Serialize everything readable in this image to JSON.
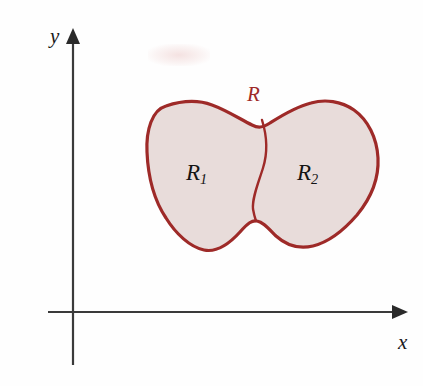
{
  "figure": {
    "type": "math-region-diagram",
    "background_color": "#fefefe"
  },
  "axes": {
    "x_label": "x",
    "y_label": "y",
    "axis_color": "#3a3a3a",
    "origin": {
      "x": 73,
      "y": 312
    },
    "x_axis": {
      "start_x": 48,
      "end_x": 400,
      "y": 312,
      "arrow": "right"
    },
    "y_axis": {
      "x": 73,
      "start_y": 365,
      "end_y": 30,
      "arrow": "up"
    }
  },
  "region": {
    "outline_color": "#9e2a28",
    "fill_color": "#e8dcda",
    "divider_color": "#9e2a28",
    "boundary_label": "R",
    "subregions": [
      {
        "id": "R1",
        "label": "R",
        "subscript": "1"
      },
      {
        "id": "R2",
        "label": "R",
        "subscript": "2"
      }
    ]
  },
  "artifacts": {
    "smudge": "faint-pink-scan-smudge"
  }
}
